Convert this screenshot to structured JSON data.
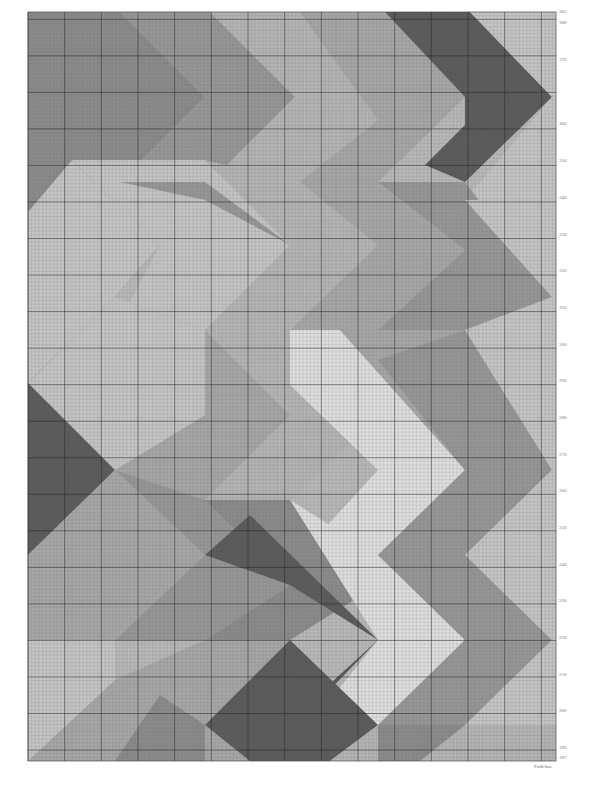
{
  "chart_data": {
    "type": "knitting-chart",
    "title": "",
    "grid": {
      "left": 28,
      "top": 12,
      "right": 556,
      "bottom": 761,
      "cell_px": 3.66,
      "major_every": 10,
      "minor_color": "#6e6e6e",
      "major_color": "#2a2a2a"
    },
    "row_axis": {
      "side": "right",
      "labels": [
        {
          "value": "383",
          "y": 12
        },
        {
          "value": "380",
          "y": 23
        },
        {
          "value": "370",
          "y": 60
        },
        {
          "value": "360",
          "y": 124
        },
        {
          "value": "350",
          "y": 161
        },
        {
          "value": "340",
          "y": 198
        },
        {
          "value": "330",
          "y": 235
        },
        {
          "value": "320",
          "y": 271
        },
        {
          "value": "310",
          "y": 308
        },
        {
          "value": "300",
          "y": 345
        },
        {
          "value": "290",
          "y": 381
        },
        {
          "value": "280",
          "y": 418
        },
        {
          "value": "270",
          "y": 455
        },
        {
          "value": "260",
          "y": 491
        },
        {
          "value": "250",
          "y": 528
        },
        {
          "value": "240",
          "y": 565
        },
        {
          "value": "230",
          "y": 601
        },
        {
          "value": "220",
          "y": 638
        },
        {
          "value": "210",
          "y": 675
        },
        {
          "value": "200",
          "y": 711
        },
        {
          "value": "190",
          "y": 748
        },
        {
          "value": "187",
          "y": 758
        }
      ]
    },
    "footer_label": "Fold line",
    "palette": {
      "c1": "#8a8a8a",
      "c2": "#a6a6a6",
      "c3": "#c4c4c4",
      "c4": "#5a5a5a",
      "c5": "#dedede",
      "c6": "#969696",
      "c7": "#b4b4b4"
    },
    "background_color": "#b8b8b8",
    "shapes": [
      {
        "color": "c1",
        "points": "28,12 120,12 205,97 120,182 28,182"
      },
      {
        "color": "c6",
        "points": "120,12 210,12 295,97 210,182 120,182 205,97"
      },
      {
        "color": "c7",
        "points": "210,12 300,12 378,90 378,120 300,182 210,182 295,97"
      },
      {
        "color": "c2",
        "points": "300,12 385,12 465,97 378,182 300,182 378,120"
      },
      {
        "color": "c4",
        "points": "385,12 470,12 552,97 465,182 425,165 465,125 465,97"
      },
      {
        "color": "c3",
        "points": "470,12 556,12 556,200 465,200 552,97"
      },
      {
        "color": "c1",
        "points": "28,182 72,160 160,245 115,297 28,212"
      },
      {
        "color": "c3",
        "points": "72,160 205,160 290,245 205,330 115,330 160,245"
      },
      {
        "color": "c6",
        "points": "120,182 205,182 290,245 205,200"
      },
      {
        "color": "c7",
        "points": "205,160 300,182 378,245 290,330 205,330 290,245"
      },
      {
        "color": "c2",
        "points": "300,182 378,182 465,250 378,330 290,330 378,245"
      },
      {
        "color": "c6",
        "points": "378,182 465,182 552,297 465,330 378,330 465,250"
      },
      {
        "color": "c3",
        "points": "465,200 556,200 556,330 465,330 552,297"
      },
      {
        "color": "c4",
        "points": "28,212 115,297 28,383"
      },
      {
        "color": "c3",
        "points": "28,212 72,160 160,245 115,297 28,383 28,383"
      },
      {
        "color": "c2",
        "points": "115,297 205,330 290,415 205,500 115,470 205,415"
      },
      {
        "color": "c3",
        "points": "28,383 115,297 205,330 205,415 115,470 28,470"
      },
      {
        "color": "c7",
        "points": "205,330 290,330 378,415 290,500 205,500 290,415"
      },
      {
        "color": "c5",
        "points": "290,330 340,330 465,470 378,555 300,555 378,470 290,385"
      },
      {
        "color": "c2",
        "points": "340,330 465,330 552,470 465,470"
      },
      {
        "color": "c6",
        "points": "378,360 465,330 552,470 465,555 378,555 465,470"
      },
      {
        "color": "c3",
        "points": "465,330 556,330 556,555 465,555 552,470"
      },
      {
        "color": "c4",
        "points": "28,383 115,470 28,555"
      },
      {
        "color": "c2",
        "points": "28,555 115,470 205,555 115,640 28,640"
      },
      {
        "color": "c6",
        "points": "115,470 205,500 290,585 205,640 115,640 205,555"
      },
      {
        "color": "c1",
        "points": "205,500 290,500 378,585 290,640 205,640 290,585"
      },
      {
        "color": "c4",
        "points": "205,555 250,515 378,640 320,700 290,720 378,640 290,585"
      },
      {
        "color": "c5",
        "points": "290,500 378,555 465,640 378,725 330,700 378,640"
      },
      {
        "color": "c6",
        "points": "378,555 465,555 552,640 465,725 378,725 465,640"
      },
      {
        "color": "c3",
        "points": "465,555 556,555 556,725 465,725 552,640"
      },
      {
        "color": "c3",
        "points": "28,640 115,640 115,725 28,761"
      },
      {
        "color": "c2",
        "points": "28,761 115,680 205,640 205,761"
      },
      {
        "color": "c1",
        "points": "115,761 160,695 205,725 205,761"
      },
      {
        "color": "c2",
        "points": "205,640 290,640 290,761 205,761"
      },
      {
        "color": "c4",
        "points": "205,725 290,640 378,725 330,761 250,761"
      },
      {
        "color": "c7",
        "points": "330,761 378,725 465,725 465,761"
      },
      {
        "color": "c1",
        "points": "378,725 465,725 420,761 378,761"
      },
      {
        "color": "c7",
        "points": "465,725 556,725 556,761 465,761"
      }
    ]
  }
}
